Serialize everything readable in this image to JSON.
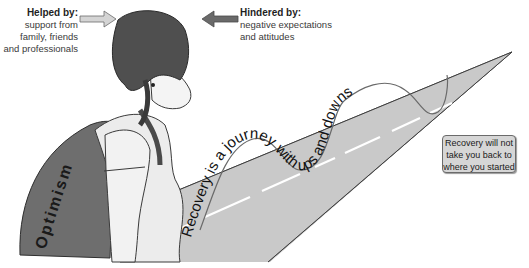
{
  "helped": {
    "title": "Helped by:",
    "lines": [
      "support from",
      "family, friends",
      "and professionals"
    ],
    "arrow_direction": "right"
  },
  "hindered": {
    "title": "Hindered by:",
    "lines": [
      "negative expectations",
      "and attitudes"
    ],
    "arrow_direction": "left"
  },
  "journey_text": "Recovery is a journey with ups and downs",
  "backpack_text": "Optimism",
  "note": {
    "lines": [
      "Recovery will not",
      "take you back to",
      "where you started"
    ]
  },
  "colors": {
    "road": "#c9c9c9",
    "road_edge": "#4a4a4a",
    "lane_dash": "#ffffff",
    "hair": "#4f4f4f",
    "backpack": "#6e6e6e",
    "shirt": "#ececec",
    "skin": "#f4f4f4",
    "note_bg": "#d6d6d6",
    "helped_arrow": "#d4d4d4",
    "hindered_arrow": "#6a6a6a"
  }
}
